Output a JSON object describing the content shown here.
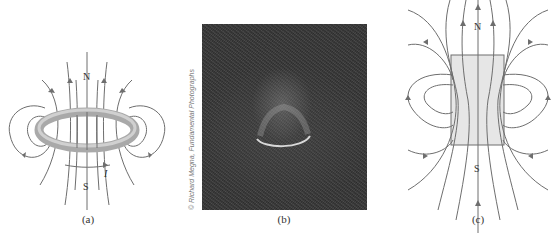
{
  "figure": {
    "panels": [
      {
        "id": "a",
        "caption": "(a)",
        "north_label": "N",
        "south_label": "S",
        "current_label": "I",
        "description": "Field lines of a current loop"
      },
      {
        "id": "b",
        "caption": "(b)",
        "description": "Iron filings photo around a current loop",
        "credit": "© Richard Megna, Fundamental Photographs"
      },
      {
        "id": "c",
        "caption": "(c)",
        "north_label": "N",
        "south_label": "S",
        "description": "Field lines of a bar magnet"
      }
    ],
    "colors": {
      "line": "#6e6e6e",
      "ring": "#b8b8b8",
      "block": "#e6e6e6",
      "photo_bg": "#363636"
    }
  }
}
